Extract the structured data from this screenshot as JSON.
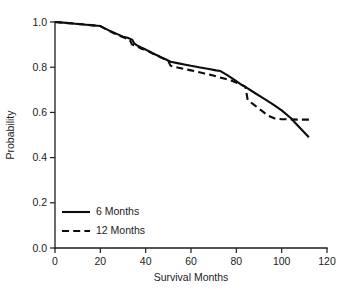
{
  "chart_data": {
    "type": "line",
    "title": "",
    "xlabel": "Survival Months",
    "ylabel": "Probability",
    "xlim": [
      0,
      120
    ],
    "ylim": [
      0.0,
      1.0
    ],
    "xticks": [
      0,
      20,
      40,
      60,
      80,
      100,
      120
    ],
    "yticks": [
      0.0,
      0.2,
      0.4,
      0.6,
      0.8,
      1.0
    ],
    "xtick_labels": [
      "0",
      "20",
      "40",
      "60",
      "80",
      "100",
      "120"
    ],
    "ytick_labels": [
      "0.0",
      "0.2",
      "0.4",
      "0.6",
      "0.8",
      "1.0"
    ],
    "grid": false,
    "legend_position": "lower-left",
    "line_color": "#0d0d0d",
    "series": [
      {
        "name": "6 Months",
        "style": "solid",
        "x": [
          0,
          5,
          10,
          15,
          20,
          22,
          24,
          26,
          28,
          30,
          32,
          34,
          35,
          36,
          38,
          40,
          41,
          43,
          45,
          47,
          49,
          51,
          54,
          57,
          60,
          64,
          68,
          71,
          73,
          76,
          79,
          82,
          85,
          88,
          92,
          96,
          100,
          104,
          108,
          112
        ],
        "y": [
          1.0,
          0.996,
          0.991,
          0.987,
          0.982,
          0.972,
          0.962,
          0.953,
          0.944,
          0.935,
          0.93,
          0.922,
          0.905,
          0.898,
          0.887,
          0.878,
          0.873,
          0.862,
          0.853,
          0.843,
          0.834,
          0.824,
          0.818,
          0.812,
          0.806,
          0.799,
          0.792,
          0.786,
          0.783,
          0.765,
          0.745,
          0.724,
          0.706,
          0.687,
          0.662,
          0.637,
          0.609,
          0.575,
          0.532,
          0.49
        ]
      },
      {
        "name": "12 Months",
        "style": "dashed",
        "x": [
          0,
          6,
          12,
          18,
          20,
          23,
          26,
          29,
          31,
          33,
          34,
          36,
          38,
          40,
          42,
          44,
          46,
          48,
          50,
          51,
          54,
          57,
          60,
          63,
          66,
          69,
          72,
          75,
          78,
          81,
          84,
          85,
          88,
          91,
          94,
          97,
          100,
          104,
          108,
          113
        ],
        "y": [
          1.0,
          0.995,
          0.99,
          0.984,
          0.982,
          0.965,
          0.95,
          0.937,
          0.929,
          0.92,
          0.9,
          0.893,
          0.882,
          0.877,
          0.866,
          0.857,
          0.847,
          0.837,
          0.827,
          0.806,
          0.799,
          0.792,
          0.786,
          0.779,
          0.772,
          0.765,
          0.757,
          0.749,
          0.74,
          0.728,
          0.714,
          0.655,
          0.632,
          0.609,
          0.586,
          0.573,
          0.57,
          0.569,
          0.568,
          0.568
        ]
      }
    ],
    "legend": [
      {
        "label": "6 Months",
        "style": "solid"
      },
      {
        "label": "12 Months",
        "style": "dashed"
      }
    ]
  }
}
